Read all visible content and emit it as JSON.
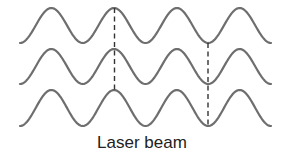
{
  "caption": "Laser beam",
  "colors": {
    "wave": "#6e6e6e",
    "guide": "#333333",
    "text": "#222222"
  },
  "waves": {
    "x_start": 20,
    "x_end": 271,
    "period": 62.75,
    "rows": [
      {
        "peak_y": 8,
        "trough_y": 43
      },
      {
        "peak_y": 49,
        "trough_y": 84
      },
      {
        "peak_y": 90,
        "trough_y": 126
      }
    ]
  },
  "guides": [
    {
      "x": 114.5,
      "y1": 8,
      "y2": 90,
      "aligns": "peaks"
    },
    {
      "x": 208,
      "y1": 43,
      "y2": 126,
      "aligns": "troughs"
    }
  ]
}
